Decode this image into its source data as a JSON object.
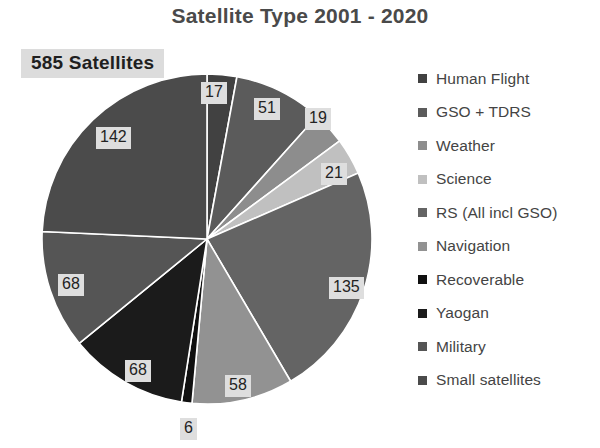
{
  "chart_data": {
    "type": "pie",
    "title": "Satellite Type 2001 - 2020",
    "total_label": "585 Satellites",
    "total": 585,
    "legend_position": "right",
    "grid": false,
    "xlabel": "",
    "ylabel": "",
    "start_angle_deg": 0,
    "direction": "clockwise",
    "categories": [
      "Human Flight",
      "GSO + TDRS",
      "Weather",
      "Science",
      "RS (All incl GSO)",
      "Navigation",
      "Recoverable",
      "Yaogan",
      "Military",
      "Small satellites"
    ],
    "values": [
      17,
      51,
      19,
      21,
      135,
      58,
      6,
      68,
      68,
      142
    ],
    "colors": [
      "#414141",
      "#5b5b5b",
      "#8d8d8d",
      "#c0c0c0",
      "#646464",
      "#929292",
      "#101010",
      "#1b1b1b",
      "#555555",
      "#4b4b4b"
    ],
    "slices": [
      {
        "label": "Human Flight",
        "value": 17,
        "color": "#414141",
        "label_x": 201,
        "label_y": 82
      },
      {
        "label": "GSO + TDRS",
        "value": 51,
        "color": "#5b5b5b",
        "label_x": 254,
        "label_y": 98
      },
      {
        "label": "Weather",
        "value": 19,
        "color": "#8d8d8d",
        "label_x": 305,
        "label_y": 108
      },
      {
        "label": "Science",
        "value": 21,
        "color": "#c0c0c0",
        "label_x": 321,
        "label_y": 163
      },
      {
        "label": "RS (All incl GSO)",
        "value": 135,
        "color": "#646464",
        "label_x": 329,
        "label_y": 277
      },
      {
        "label": "Navigation",
        "value": 58,
        "color": "#929292",
        "label_x": 225,
        "label_y": 375
      },
      {
        "label": "Recoverable",
        "value": 6,
        "color": "#101010",
        "label_x": 180,
        "label_y": 418
      },
      {
        "label": "Yaogan",
        "value": 68,
        "color": "#1b1b1b",
        "label_x": 125,
        "label_y": 360
      },
      {
        "label": "Military",
        "value": 68,
        "color": "#555555",
        "label_x": 58,
        "label_y": 274
      },
      {
        "label": "Small satellites",
        "value": 142,
        "color": "#4b4b4b",
        "label_x": 96,
        "label_y": 127
      }
    ]
  },
  "theme": {
    "background": "#ffffff",
    "title_color": "#4a4a4a",
    "legend_text_color": "#444444",
    "label_box_bg": "#dedede",
    "label_text_color": "#232323",
    "callout_bg": "#dcdcdc",
    "slice_divider": "#ffffff"
  },
  "geometry": {
    "center_x": 167,
    "center_y": 167,
    "radius": 165
  }
}
